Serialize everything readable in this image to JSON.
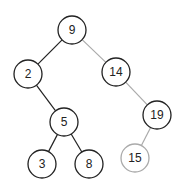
{
  "diagram": {
    "type": "binary-search-tree",
    "colors": {
      "primary": "#222222",
      "faded": "#aaaaaa",
      "background": "#ffffff"
    },
    "nodes": [
      {
        "id": "n9",
        "label": "9",
        "x": 72,
        "y": 30,
        "style": "primary"
      },
      {
        "id": "n2",
        "label": "2",
        "x": 28,
        "y": 74,
        "style": "primary"
      },
      {
        "id": "n14",
        "label": "14",
        "x": 116,
        "y": 72,
        "style": "primary"
      },
      {
        "id": "n5",
        "label": "5",
        "x": 64,
        "y": 122,
        "style": "primary"
      },
      {
        "id": "n19",
        "label": "19",
        "x": 157,
        "y": 115,
        "style": "primary"
      },
      {
        "id": "n3",
        "label": "3",
        "x": 42,
        "y": 164,
        "style": "primary"
      },
      {
        "id": "n8",
        "label": "8",
        "x": 89,
        "y": 164,
        "style": "primary"
      },
      {
        "id": "n15",
        "label": "15",
        "x": 135,
        "y": 158,
        "style": "faded"
      }
    ],
    "edges": [
      {
        "from": "n9",
        "to": "n2",
        "style": "primary"
      },
      {
        "from": "n9",
        "to": "n14",
        "style": "faded"
      },
      {
        "from": "n2",
        "to": "n5",
        "style": "primary"
      },
      {
        "from": "n14",
        "to": "n19",
        "style": "faded"
      },
      {
        "from": "n5",
        "to": "n3",
        "style": "primary"
      },
      {
        "from": "n5",
        "to": "n8",
        "style": "primary"
      },
      {
        "from": "n19",
        "to": "n15",
        "style": "faded"
      }
    ],
    "node_radius": 14
  }
}
